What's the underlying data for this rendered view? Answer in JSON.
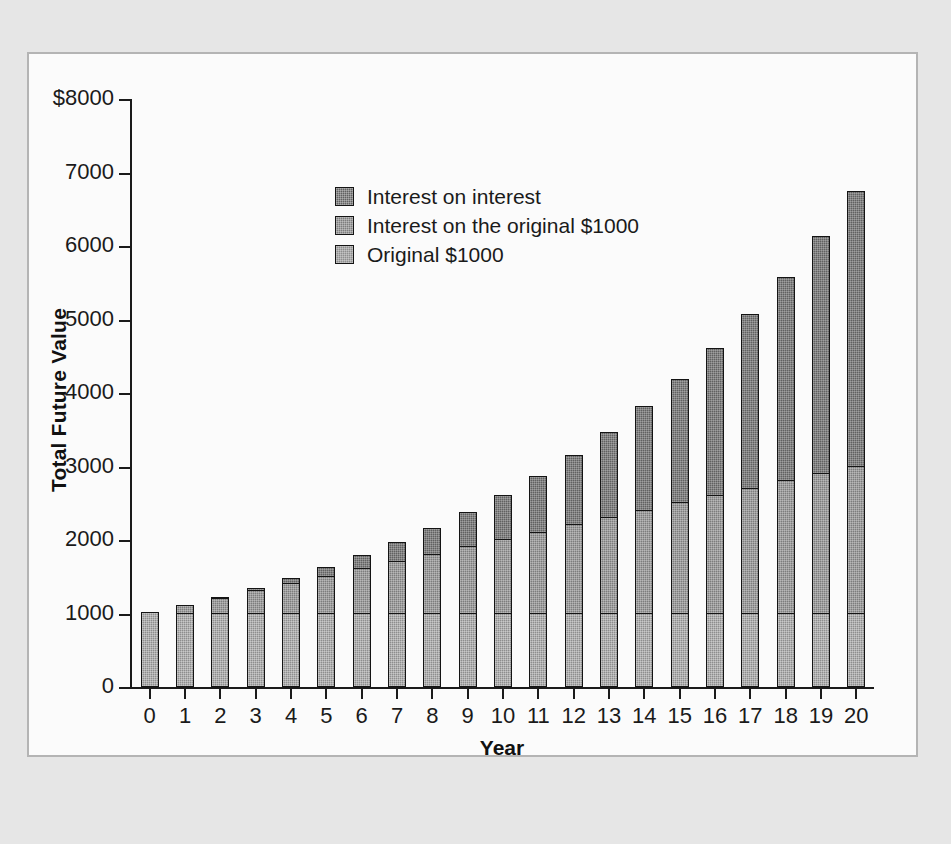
{
  "chart_data": {
    "type": "bar",
    "subtype": "stacked-bar",
    "title": "",
    "xlabel": "Year",
    "ylabel": "Total Future Value",
    "grid": false,
    "legend_position": "inside-top-left",
    "xlim": [
      -0.5,
      20.5
    ],
    "ylim": [
      0,
      8000
    ],
    "ytick_labels": [
      "$8000",
      "7000",
      "6000",
      "5000",
      "4000",
      "3000",
      "2000",
      "1000",
      "0"
    ],
    "ytick_values": [
      8000,
      7000,
      6000,
      5000,
      4000,
      3000,
      2000,
      1000,
      0
    ],
    "categories": [
      "0",
      "1",
      "2",
      "3",
      "4",
      "5",
      "6",
      "7",
      "8",
      "9",
      "10",
      "11",
      "12",
      "13",
      "14",
      "15",
      "16",
      "17",
      "18",
      "19",
      "20"
    ],
    "series": [
      {
        "name": "Original $1000",
        "color": "#8e8e8e",
        "values": [
          1000,
          1000,
          1000,
          1000,
          1000,
          1000,
          1000,
          1000,
          1000,
          1000,
          1000,
          1000,
          1000,
          1000,
          1000,
          1000,
          1000,
          1000,
          1000,
          1000,
          1000
        ]
      },
      {
        "name": "Interest on the original $1000",
        "color": "#7d7d7d",
        "values": [
          0,
          100,
          200,
          300,
          400,
          500,
          600,
          700,
          800,
          900,
          1000,
          1100,
          1200,
          1300,
          1400,
          1500,
          1600,
          1700,
          1800,
          1900,
          2000
        ]
      },
      {
        "name": "Interest on interest",
        "color": "#616161",
        "values": [
          0,
          0,
          10,
          31,
          64,
          111,
          172,
          249,
          344,
          459,
          594,
          753,
          938,
          1152,
          1397,
          1677,
          1995,
          2355,
          2760,
          3215,
          3727
        ]
      }
    ],
    "totals": [
      1000,
      1100,
      1210,
      1331,
      1464,
      1611,
      1772,
      1949,
      2144,
      2359,
      2594,
      2853,
      3138,
      3452,
      3797,
      4177,
      4595,
      5055,
      5560,
      6115,
      6727
    ]
  },
  "legend": {
    "items": [
      {
        "label": "Interest on interest",
        "swatch": "#616161",
        "series_index": 2
      },
      {
        "label": "Interest on the original $1000",
        "swatch": "#7d7d7d",
        "series_index": 1
      },
      {
        "label": "Original $1000",
        "swatch": "#8e8e8e",
        "series_index": 0
      }
    ]
  },
  "colors": {
    "page_background": "#e6e6e6",
    "panel_background": "#fbfbfb",
    "panel_border": "#b4b4b4",
    "axis": "#1a1a1a",
    "text": "#1a1a1a"
  }
}
